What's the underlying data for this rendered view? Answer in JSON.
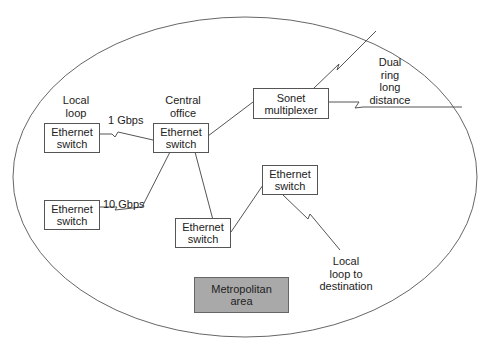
{
  "diagram": {
    "region_label": "Metropolitan area",
    "region_label_lines": [
      "Metropolitan",
      "area"
    ],
    "colors": {
      "line": "#555555",
      "box_border": "#555555",
      "region_box_fill": "#a9a9a9",
      "background": "#ffffff"
    },
    "nodes": [
      {
        "id": "local-switch",
        "lines": [
          "Ethernet",
          "switch"
        ],
        "caption_lines": [
          "Local",
          "loop"
        ]
      },
      {
        "id": "central-switch",
        "lines": [
          "Ethernet",
          "switch"
        ],
        "caption_lines": [
          "Central",
          "office"
        ]
      },
      {
        "id": "sonet-mux",
        "lines": [
          "Sonet",
          "multiplexer"
        ]
      },
      {
        "id": "lower-left-switch",
        "lines": [
          "Ethernet",
          "switch"
        ]
      },
      {
        "id": "lower-middle-switch",
        "lines": [
          "Ethernet",
          "switch"
        ]
      },
      {
        "id": "right-switch",
        "lines": [
          "Ethernet",
          "switch"
        ]
      }
    ],
    "links": [
      {
        "from": "local-switch",
        "to": "central-switch",
        "label": "1 Gbps",
        "style": "lightning"
      },
      {
        "from": "lower-left-switch",
        "to": "central-switch",
        "label": "10 Gbps",
        "style": "lightning"
      },
      {
        "from": "central-switch",
        "to": "sonet-mux",
        "style": "straight"
      },
      {
        "from": "central-switch",
        "to": "lower-middle-switch",
        "style": "straight"
      },
      {
        "from": "lower-middle-switch",
        "to": "right-switch",
        "style": "straight"
      },
      {
        "from": "right-switch",
        "to": "destination",
        "style": "lightning"
      },
      {
        "from": "sonet-mux",
        "to": "long-distance-upper",
        "style": "lightning"
      },
      {
        "from": "sonet-mux",
        "to": "long-distance-right",
        "style": "lightning"
      }
    ],
    "annotations": {
      "dual_ring_lines": [
        "Dual",
        "ring",
        "long",
        "distance"
      ],
      "destination_lines": [
        "Local",
        "loop to",
        "destination"
      ]
    }
  }
}
